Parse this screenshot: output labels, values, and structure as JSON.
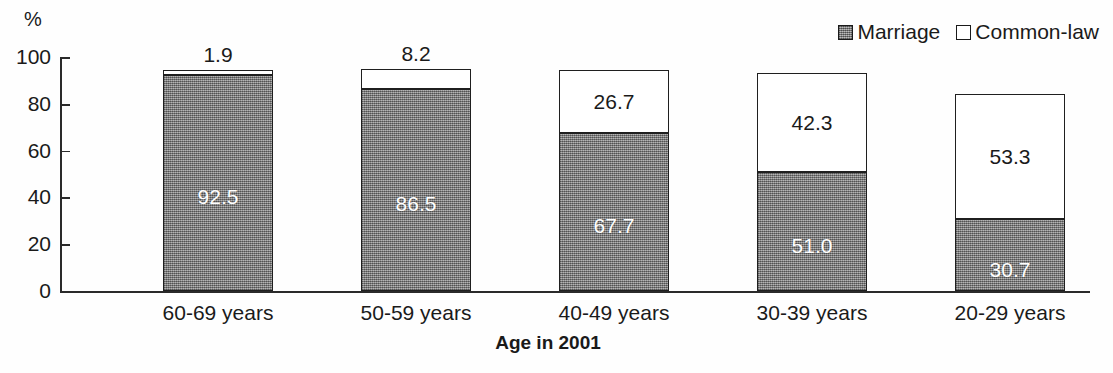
{
  "chart_data": {
    "type": "bar",
    "subtype": "stacked-bar",
    "title": "",
    "xlabel": "Age in 2001",
    "ylabel": "%",
    "ylim": [
      0,
      100
    ],
    "yticks": [
      0,
      20,
      40,
      60,
      80,
      100
    ],
    "grid": false,
    "legend_position": "top-right",
    "categories": [
      "60-69 years",
      "50-59 years",
      "40-49 years",
      "30-39 years",
      "20-29 years"
    ],
    "series": [
      {
        "name": "Marriage",
        "swatch": "filled",
        "color": "#8c8c8c",
        "values": [
          92.5,
          86.5,
          67.7,
          51.0,
          30.7
        ],
        "labels": [
          "92.5",
          "86.5",
          "67.7",
          "51.0",
          "30.7"
        ],
        "label_placement": [
          "inside",
          "inside",
          "inside",
          "inside",
          "inside"
        ]
      },
      {
        "name": "Common-law",
        "swatch": "hollow",
        "color": "#ffffff",
        "values": [
          1.9,
          8.2,
          26.7,
          42.3,
          53.3
        ],
        "labels": [
          "1.9",
          "8.2",
          "26.7",
          "42.3",
          "53.3"
        ],
        "label_placement": [
          "above",
          "above",
          "inside",
          "inside",
          "inside"
        ]
      }
    ]
  },
  "legend": {
    "items": [
      {
        "label": "Marriage"
      },
      {
        "label": "Common-law"
      }
    ]
  },
  "axes": {
    "y_unit": "%",
    "y_tick_labels": [
      "100",
      "80",
      "60",
      "40",
      "20",
      "0"
    ],
    "x_axis_title": "Age in 2001"
  }
}
